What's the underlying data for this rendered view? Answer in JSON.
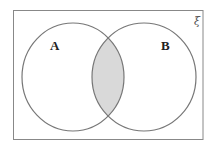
{
  "diagram": {
    "type": "venn",
    "universal_symbol": "ξ",
    "sets": [
      {
        "label": "A",
        "position": "left"
      },
      {
        "label": "B",
        "position": "right"
      }
    ],
    "shaded_region": "A ∩ B",
    "colors": {
      "stroke": "#777777",
      "shade": "#d9d9d9",
      "background": "#ffffff"
    }
  }
}
